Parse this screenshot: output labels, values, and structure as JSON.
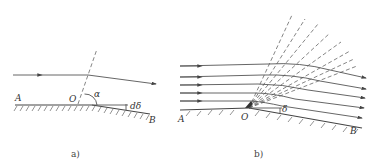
{
  "figure_a": {
    "caption": "a)",
    "labels": {
      "A": "A",
      "O": "O",
      "B": "B",
      "alpha": "α",
      "d_delta": "dδ"
    },
    "description": "Single streamline deflected by an infinitesimal turning angle dδ at corner O; Mach wave at angle α"
  },
  "figure_b": {
    "caption": "b)",
    "labels": {
      "A": "A",
      "O": "O",
      "B": "B",
      "delta": "δ"
    },
    "streamline_count": 5,
    "mach_wave_count": 8,
    "description": "Prandtl–Meyer expansion fan: parallel streamlines turn through angle δ around convex corner O via a fan of Mach waves"
  },
  "colors": {
    "line": "#555555",
    "background": "#ffffff"
  }
}
